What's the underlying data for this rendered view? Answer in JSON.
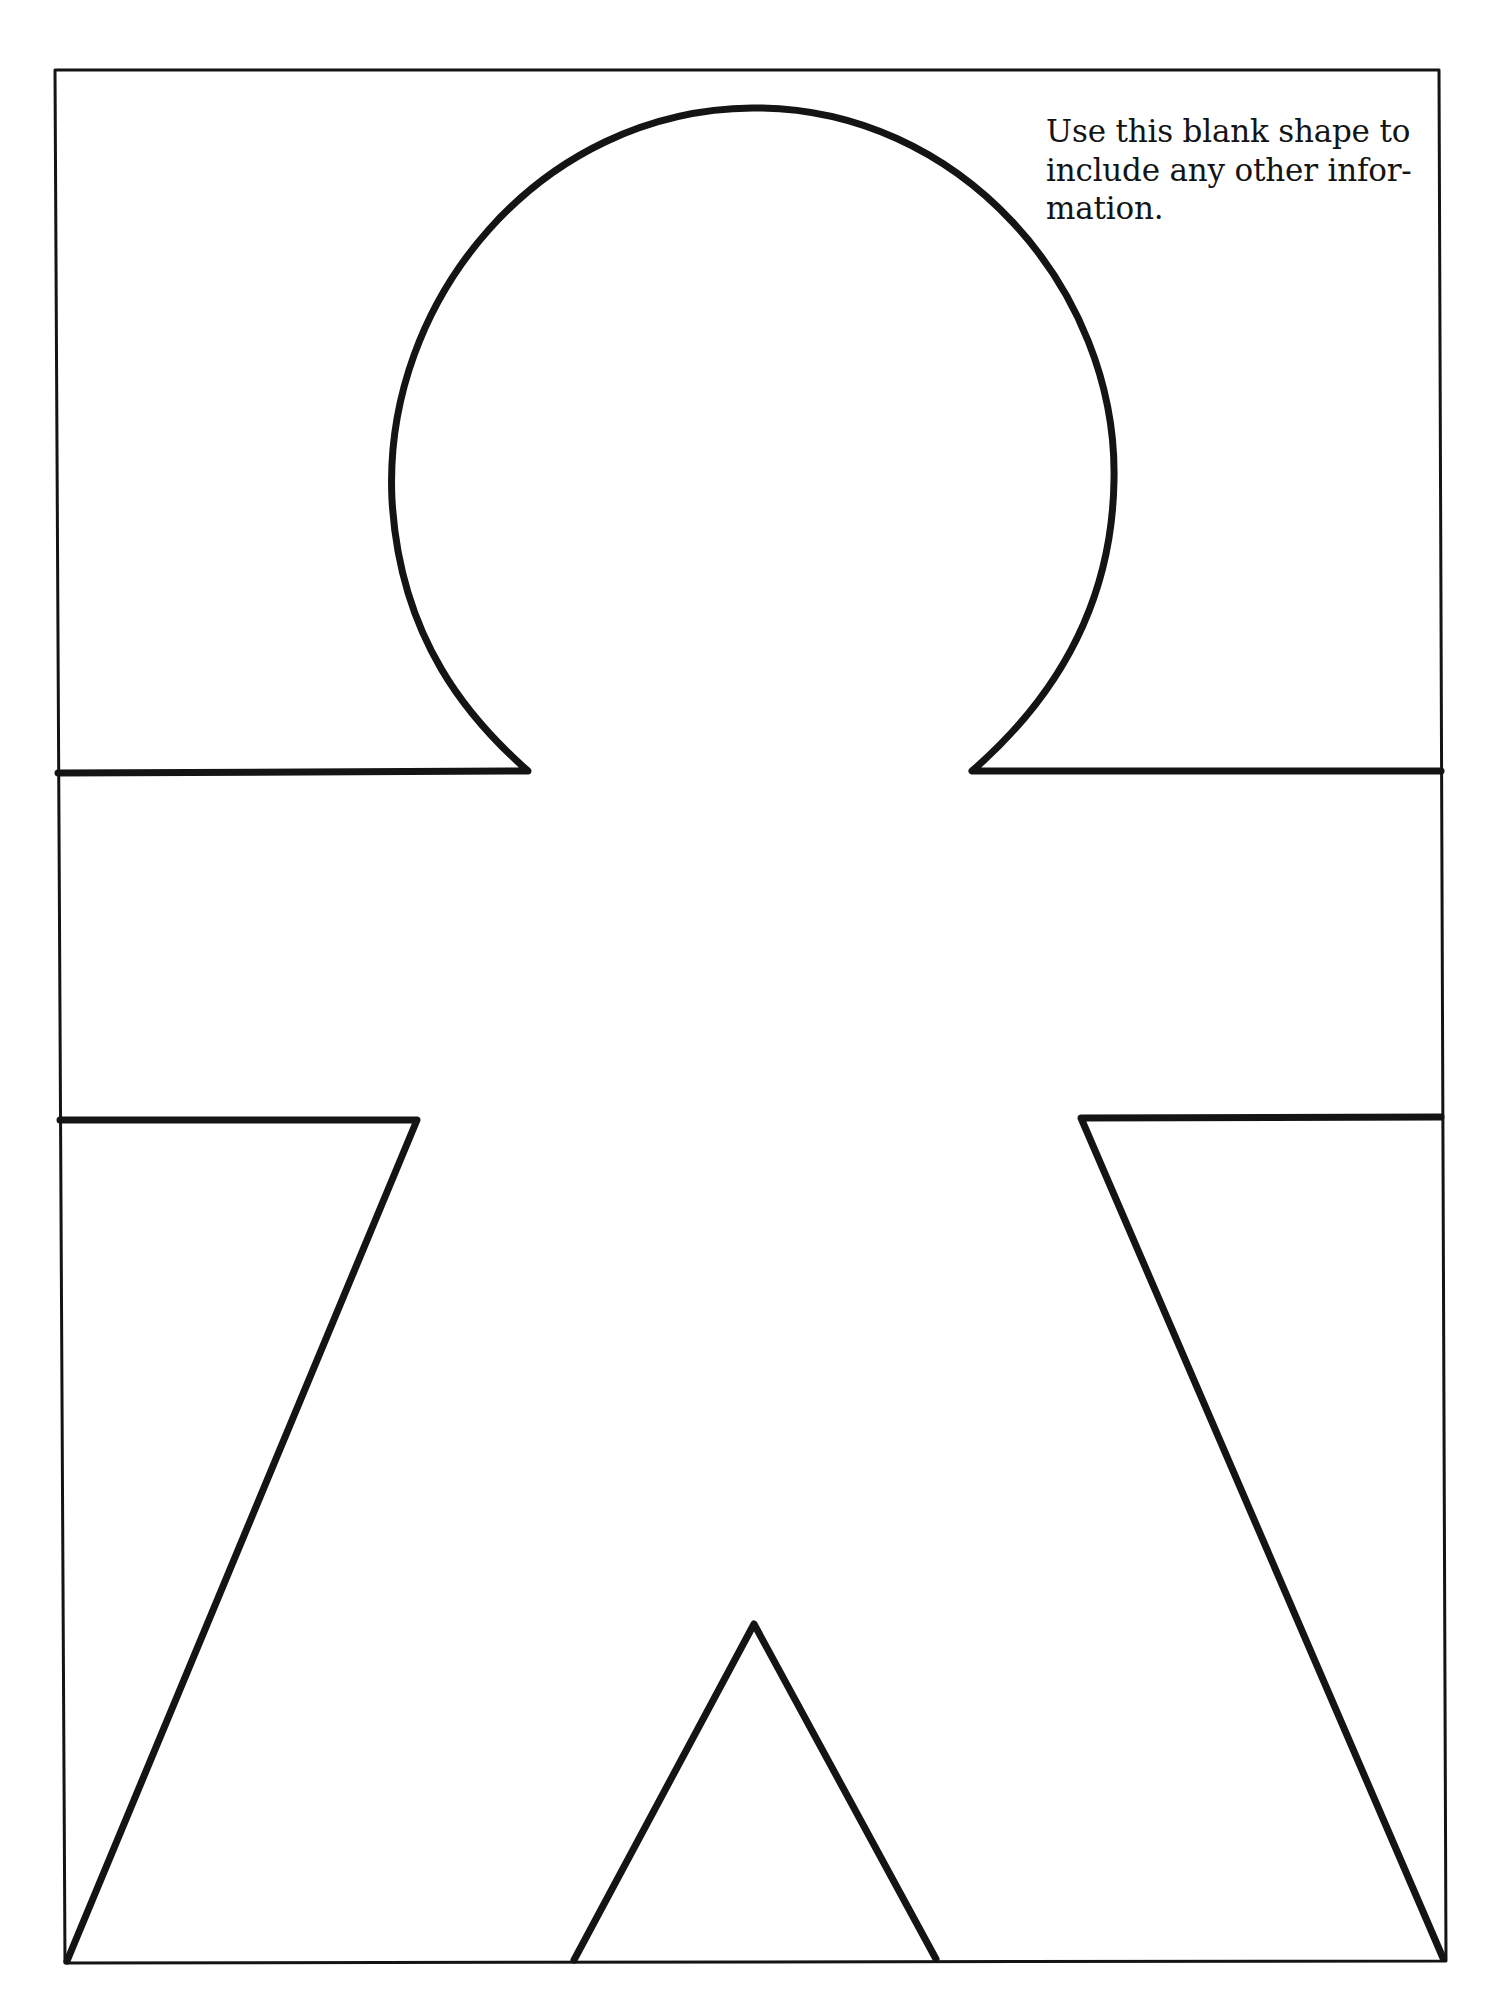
{
  "document": {
    "type": "worksheet-template",
    "instruction_lines": [
      "Use this blank shape to",
      "include any other infor-",
      "mation."
    ],
    "instruction_text": "Use this blank shape to include any other information.",
    "figure": {
      "shape": "person-outline",
      "description": "Blank gingerbread-style human figure outline with round head, arms extending to frame edges, and two legs"
    },
    "colors": {
      "ink": "#141414",
      "paper": "#ffffff"
    }
  }
}
